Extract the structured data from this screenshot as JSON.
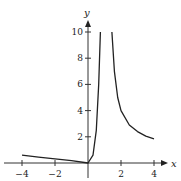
{
  "chart_data": {
    "type": "line",
    "title": "",
    "xlabel": "x",
    "ylabel": "y",
    "xlim": [
      -4.5,
      4.5
    ],
    "ylim": [
      0,
      10.5
    ],
    "x_ticks": [
      -4,
      -2,
      2,
      4
    ],
    "x_tick_labels": [
      "−4",
      "−2",
      "2",
      "4"
    ],
    "y_ticks": [
      2,
      4,
      6,
      8,
      10
    ],
    "y_tick_labels": [
      "2",
      "4",
      "6",
      "8",
      "10"
    ],
    "grid": false,
    "legend": null,
    "series": [
      {
        "name": "left branch",
        "points": [
          [
            -4,
            0.6
          ],
          [
            -3,
            0.45
          ],
          [
            -2,
            0.32
          ],
          [
            -1,
            0.18
          ],
          [
            0,
            0
          ],
          [
            0.3,
            0.6
          ],
          [
            0.5,
            2.5
          ],
          [
            0.65,
            6
          ],
          [
            0.75,
            10
          ]
        ]
      },
      {
        "name": "right branch",
        "points": [
          [
            1.45,
            10
          ],
          [
            1.6,
            7
          ],
          [
            1.8,
            5
          ],
          [
            2,
            4
          ],
          [
            2.5,
            2.9
          ],
          [
            3,
            2.4
          ],
          [
            3.5,
            2.05
          ],
          [
            4,
            1.85
          ]
        ]
      }
    ],
    "asymptote_x": 1.1
  },
  "axes": {
    "x_label": "x",
    "y_label": "y"
  }
}
